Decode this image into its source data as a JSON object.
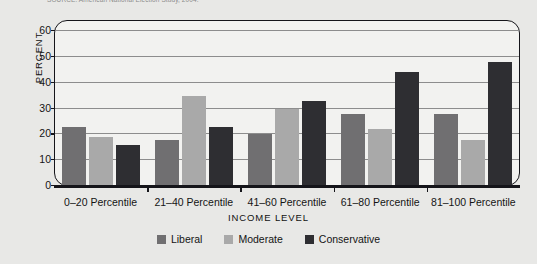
{
  "source_caption": "SOURCE: American National Election Study, 2004.",
  "chart_data": {
    "type": "bar",
    "title": "",
    "xlabel": "INCOME LEVEL",
    "ylabel": "PERCENT",
    "ylim": [
      0,
      60
    ],
    "yticks": [
      0,
      10,
      20,
      30,
      40,
      50,
      60
    ],
    "grid": true,
    "legend_position": "bottom",
    "categories": [
      "0–20 Percentile",
      "21–40 Percentile",
      "41–60 Percentile",
      "61–80 Percentile",
      "81–100 Percentile"
    ],
    "series": [
      {
        "name": "Liberal",
        "color": "#706f71",
        "values": [
          23,
          18,
          20,
          28,
          28
        ]
      },
      {
        "name": "Moderate",
        "color": "#a9a9a9",
        "values": [
          19,
          35,
          30,
          22,
          18
        ]
      },
      {
        "name": "Conservative",
        "color": "#2e2e32",
        "values": [
          16,
          23,
          33,
          44,
          48
        ]
      }
    ]
  },
  "colors": {
    "background": "#e8e8e6",
    "plot_background": "#f2f2f0",
    "axis": "#15151a",
    "gridline": "#8d8d8d"
  }
}
